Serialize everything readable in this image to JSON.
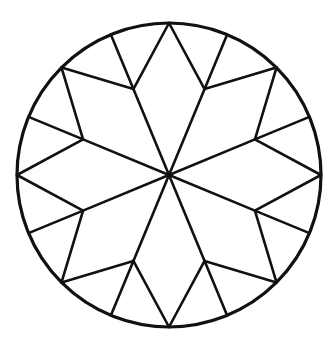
{
  "figure": {
    "title": "",
    "stroke_color": "#111111",
    "background": "#ffffff",
    "center": [
      169,
      175
    ],
    "circle_radius": 152,
    "inner_radius": 93,
    "points": 8,
    "circle_stroke_width": 3.2,
    "line_stroke_width": 2.6
  }
}
